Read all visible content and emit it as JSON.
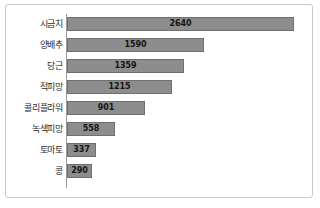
{
  "chart_data": {
    "type": "bar",
    "orientation": "horizontal",
    "title": "",
    "xlabel": "",
    "ylabel": "",
    "categories": [
      "시금치",
      "양배추",
      "당근",
      "적피망",
      "콜리플라워",
      "녹색피망",
      "토마토",
      "콩"
    ],
    "values": [
      2640,
      1590,
      1359,
      1215,
      901,
      558,
      337,
      290
    ],
    "value_labels": [
      "2640",
      "1590",
      "1359",
      "1215",
      "901",
      "558",
      "337",
      "290"
    ],
    "xlim": [
      0,
      2800
    ],
    "grid": false,
    "legend": false,
    "bar_color": "#8d8d8d",
    "bar_border_color": "#6f6f6f",
    "axis_color": "#9a9a9a",
    "frame_color": "#c9c9c9",
    "background_color": "#ffffff",
    "label_color": "#2b2b2b",
    "value_label_color": "#141414"
  }
}
